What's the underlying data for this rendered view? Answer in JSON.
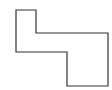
{
  "canvas": {
    "width": 112,
    "height": 90,
    "background": "#ffffff"
  },
  "shape": {
    "type": "polygon",
    "points": "16,10 36,10 36,33 108,33 108,86 67,86 67,52 16,52",
    "stroke": "#333333",
    "stroke_width": 1.2,
    "fill": "none"
  }
}
